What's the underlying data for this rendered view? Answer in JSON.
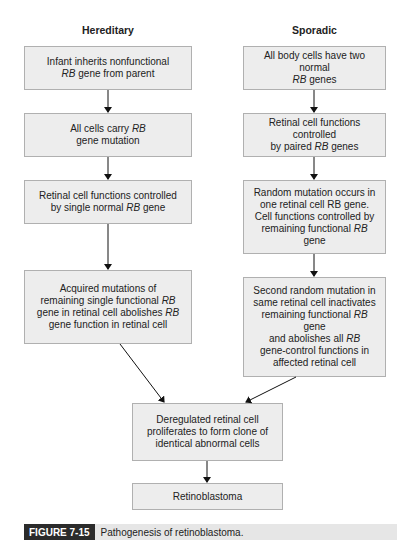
{
  "columns": {
    "hereditary": {
      "title": "Hereditary",
      "steps": [
        [
          "Infant inherits nonfunctional",
          "RB gene from parent"
        ],
        [
          "All cells carry RB",
          "gene mutation"
        ],
        [
          "Retinal cell functions controlled",
          "by single normal RB gene"
        ],
        [
          "Acquired mutations of",
          "remaining single functional RB",
          "gene in retinal cell abolishes RB",
          "gene function in retinal cell"
        ]
      ]
    },
    "sporadic": {
      "title": "Sporadic",
      "steps": [
        [
          "All body cells have two normal",
          "RB genes"
        ],
        [
          "Retinal cell functions controlled",
          "by paired RB genes"
        ],
        [
          "Random mutation occurs in",
          "one retinal cell RB gene.",
          "Cell functions controlled by",
          "remaining functional RB gene"
        ],
        [
          "Second random mutation in",
          "same retinal cell inactivates",
          "remaining functional RB gene",
          "and abolishes all RB",
          "gene-control functions in",
          "affected retinal cell"
        ]
      ]
    }
  },
  "merged": {
    "proliferation": [
      "Deregulated retinal cell",
      "proliferates to form clone of",
      "identical abnormal cells"
    ],
    "outcome": "Retinoblastoma"
  },
  "caption": {
    "label": "FIGURE 7-15",
    "text": "Pathogenesis of retinoblastoma."
  },
  "colors": {
    "box_fill": "#ededed",
    "box_border": "#b0b0b0",
    "caption_label_bg": "#2b2b2b",
    "caption_bar_bg": "#e6e6e6"
  }
}
